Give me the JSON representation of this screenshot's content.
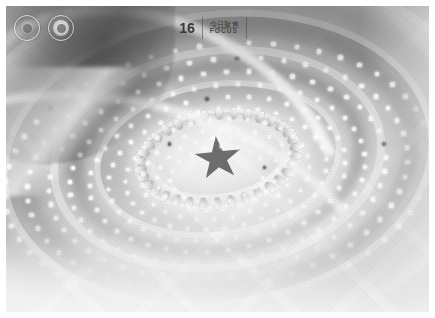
{
  "page": {
    "kind": "scanned-magazine-photo",
    "background_color": "#ffffff",
    "border_color": "#ffffff"
  },
  "header": {
    "folio": "16",
    "section_cn": "今日聚焦",
    "section_en": "FOCUS",
    "rule_color": "#464646",
    "emblems": [
      {
        "name": "national-emblem-left",
        "style": "outline"
      },
      {
        "name": "national-emblem-right",
        "style": "solid"
      }
    ]
  },
  "photo": {
    "caption": "",
    "subject": "Great Hall ceiling with central red star, concentric lighted rings and radiating lamp lattice",
    "tone": "grayscale halftone",
    "colors": {
      "highlight": "#ffffff",
      "midtone": "#9a9a9a",
      "shadow": "#4a4a4a",
      "star": "#6e6e6e"
    },
    "elements": {
      "star_points": 5,
      "petal_ring_count": 34,
      "concentric_rings": 5,
      "lamp_rows": 12
    }
  }
}
